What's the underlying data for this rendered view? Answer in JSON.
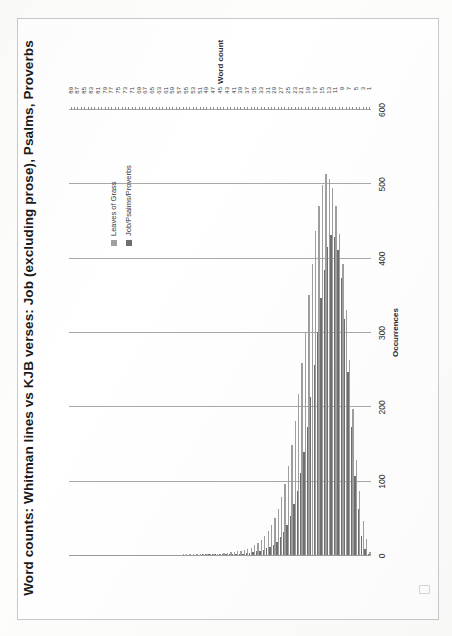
{
  "chart_data": {
    "type": "bar",
    "title": "Word counts: Whitman lines vs KJB verses: Job (excluding prose), Psalms, Proverbs",
    "xlabel": "Word count",
    "ylabel": "Occurrences",
    "ylim": [
      0,
      600
    ],
    "yticks": [
      0,
      100,
      200,
      300,
      400,
      500,
      600
    ],
    "grid": true,
    "orientation": "horizontal-bars-rotated-page",
    "legend_position": "right",
    "x": [
      1,
      2,
      3,
      4,
      5,
      6,
      7,
      8,
      9,
      10,
      11,
      12,
      13,
      14,
      15,
      16,
      17,
      18,
      19,
      20,
      21,
      22,
      23,
      24,
      25,
      26,
      27,
      28,
      29,
      30,
      31,
      32,
      33,
      34,
      35,
      36,
      37,
      38,
      39,
      40,
      41,
      42,
      43,
      44,
      45,
      46,
      47,
      48,
      49,
      50,
      51,
      52,
      53,
      54,
      55,
      56,
      57,
      58,
      59,
      60,
      61,
      62,
      63,
      64,
      65,
      66,
      67,
      68,
      69,
      70,
      71,
      72,
      73,
      74,
      75,
      76,
      77,
      78,
      79,
      80,
      81,
      82,
      83,
      84,
      85,
      86,
      87,
      88,
      89
    ],
    "xtick_labels": [
      "1",
      "3",
      "5",
      "7",
      "9",
      "11",
      "13",
      "15",
      "17",
      "19",
      "21",
      "23",
      "25",
      "27",
      "29",
      "31",
      "33",
      "35",
      "37",
      "39",
      "41",
      "43",
      "45",
      "47",
      "49",
      "51",
      "53",
      "55",
      "57",
      "59",
      "61",
      "63",
      "65",
      "67",
      "69",
      "71",
      "73",
      "75",
      "77",
      "79",
      "81",
      "83",
      "85",
      "87",
      "89"
    ],
    "series": [
      {
        "name": "Leaves of Grass",
        "color": "#9f9f9f",
        "values": [
          4,
          22,
          46,
          86,
          128,
          196,
          262,
          330,
          392,
          432,
          470,
          494,
          506,
          512,
          498,
          470,
          436,
          392,
          350,
          300,
          258,
          216,
          180,
          148,
          120,
          96,
          78,
          62,
          50,
          40,
          32,
          26,
          20,
          16,
          13,
          10,
          8,
          7,
          6,
          5,
          4,
          4,
          3,
          3,
          2,
          2,
          2,
          2,
          1,
          1,
          1,
          1,
          1,
          1,
          1,
          1,
          0,
          0,
          0,
          0,
          0,
          0,
          0,
          0,
          0,
          0,
          0,
          0,
          0,
          0,
          0,
          0,
          0,
          0,
          0,
          0,
          0,
          0,
          0,
          0,
          0,
          0,
          0,
          0,
          0,
          0,
          0,
          0,
          0
        ]
      },
      {
        "name": "Job/Psalms/Proverbs",
        "color": "#6f6f6f",
        "values": [
          1,
          8,
          26,
          62,
          106,
          172,
          246,
          318,
          372,
          410,
          428,
          430,
          414,
          384,
          346,
          300,
          256,
          212,
          172,
          138,
          110,
          86,
          68,
          52,
          40,
          31,
          24,
          18,
          14,
          11,
          9,
          7,
          6,
          5,
          4,
          3,
          3,
          2,
          2,
          2,
          2,
          1,
          1,
          1,
          1,
          1,
          1,
          1,
          1,
          1,
          0,
          0,
          0,
          0,
          0,
          0,
          0,
          0,
          0,
          0,
          0,
          0,
          0,
          0,
          0,
          0,
          0,
          0,
          0,
          0,
          0,
          0,
          0,
          0,
          0,
          0,
          0,
          0,
          0,
          0,
          0,
          0,
          0,
          0,
          0,
          0,
          0,
          0,
          0
        ]
      }
    ]
  },
  "legend": {
    "items": [
      {
        "label": "Leaves of Grass"
      },
      {
        "label": "Job/Psalms/Proverbs"
      }
    ]
  }
}
